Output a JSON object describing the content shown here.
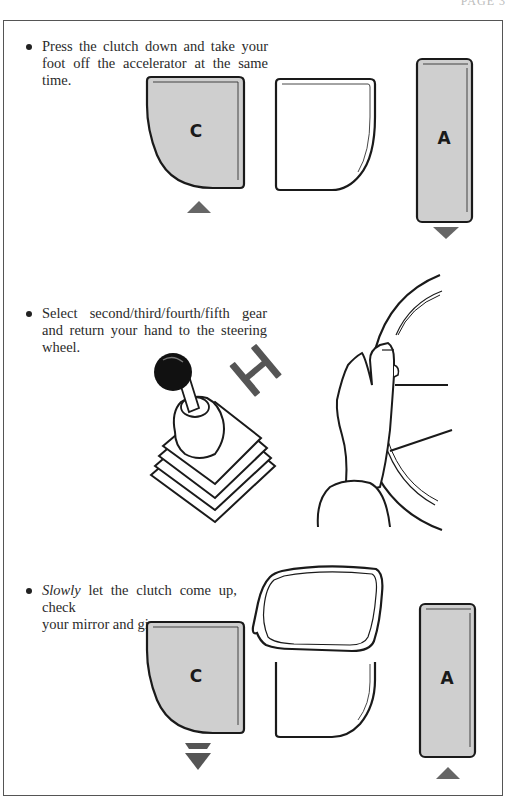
{
  "page": {
    "header_text": "PAGE 3"
  },
  "steps": [
    {
      "id": "step-1",
      "line1": "Press the clutch down and take your",
      "line2": "foot off the accelerator at the same",
      "line3": "time.",
      "illustration": {
        "type": "pedals",
        "pedals": [
          {
            "name": "clutch",
            "label": "C",
            "fill": "#cfcfcf",
            "arrow": "up"
          },
          {
            "name": "brake",
            "label": "",
            "fill": "#ffffff",
            "arrow": "none"
          },
          {
            "name": "accelerator",
            "label": "A",
            "fill": "#cfcfcf",
            "arrow": "down"
          }
        ]
      }
    },
    {
      "id": "step-2",
      "line1": "Select second/third/fourth/fifth gear",
      "line2": "and return your hand to the steering",
      "line3": "wheel.",
      "illustration": {
        "type": "gearstick-and-steering-wheel",
        "icons": [
          "gear-stick-icon",
          "gear-pattern-h-icon",
          "hand-on-steering-wheel-icon"
        ]
      }
    },
    {
      "id": "step-3",
      "emphasis": "Slowly",
      "line1_rest": " let the clutch come up, check",
      "line2": "your mirror and give more gas.",
      "illustration": {
        "type": "pedals-with-mirror",
        "pedals": [
          {
            "name": "clutch",
            "label": "C",
            "fill": "#cfcfcf",
            "arrow": "double-down"
          },
          {
            "name": "brake",
            "label": "",
            "fill": "#ffffff",
            "arrow": "none"
          },
          {
            "name": "accelerator",
            "label": "A",
            "fill": "#cfcfcf",
            "arrow": "up"
          }
        ],
        "mirror": "rear-view-mirror-icon"
      }
    }
  ],
  "colors": {
    "pedal_gray": "#cfcfcf",
    "arrow_gray": "#666666",
    "outline": "#1a1a1a",
    "frame": "#555555"
  }
}
